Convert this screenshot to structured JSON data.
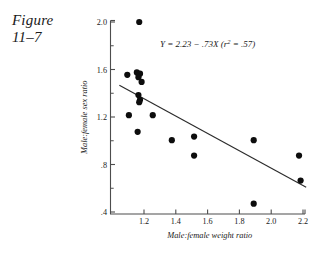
{
  "figure": {
    "label_line1": "Figure",
    "label_line2": "11–7"
  },
  "chart_data": {
    "type": "scatter",
    "title": "",
    "xlabel": "Male:female weight ratio",
    "ylabel": "Male:female sex ratio",
    "xlim": [
      1.03,
      2.25
    ],
    "ylim": [
      0.33,
      2.05
    ],
    "xticks": [
      1.2,
      1.4,
      1.6,
      1.8,
      2.0,
      2.2
    ],
    "xticklabels": [
      "1.2",
      "1.4",
      "1.6",
      "1.8",
      "2.0",
      "2.2"
    ],
    "yticks": [
      0.4,
      0.8,
      1.2,
      1.6,
      2.0
    ],
    "yticklabels": [
      ".4",
      ".8",
      "1.2",
      "1.6",
      "2.0"
    ],
    "yminorticks": [
      0.6,
      1.0,
      1.4,
      1.8
    ],
    "grid": false,
    "legend": false,
    "annotation": {
      "text": "Y = 2.23 − .73X (r² = .57)",
      "parts": {
        "response": "Y",
        "equals": "=",
        "intercept": "2.23",
        "minus": "−",
        "slope_term": ".73X",
        "r_symbol": "r",
        "r_exponent": "2",
        "r_equals": "=",
        "r_value": ".57"
      },
      "x": 1.6,
      "y": 1.79
    },
    "fit_line": {
      "intercept": 2.23,
      "slope": -0.73,
      "r_squared": 0.57,
      "x_start": 1.045,
      "x_end": 2.22
    },
    "points": [
      {
        "x": 1.17,
        "y": 2.0
      },
      {
        "x": 1.095,
        "y": 1.555
      },
      {
        "x": 1.155,
        "y": 1.575
      },
      {
        "x": 1.175,
        "y": 1.565
      },
      {
        "x": 1.165,
        "y": 1.535
      },
      {
        "x": 1.185,
        "y": 1.495
      },
      {
        "x": 1.165,
        "y": 1.385
      },
      {
        "x": 1.175,
        "y": 1.345
      },
      {
        "x": 1.17,
        "y": 1.325
      },
      {
        "x": 1.105,
        "y": 1.215
      },
      {
        "x": 1.255,
        "y": 1.215
      },
      {
        "x": 1.16,
        "y": 1.075
      },
      {
        "x": 1.375,
        "y": 1.005
      },
      {
        "x": 1.515,
        "y": 1.035
      },
      {
        "x": 1.89,
        "y": 1.005
      },
      {
        "x": 1.515,
        "y": 0.875
      },
      {
        "x": 2.175,
        "y": 0.875
      },
      {
        "x": 2.185,
        "y": 0.665
      },
      {
        "x": 1.89,
        "y": 0.47
      }
    ]
  }
}
